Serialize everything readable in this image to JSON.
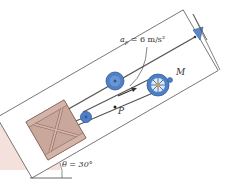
{
  "diagram": {
    "labels": {
      "acceleration": "a_P = 6 m/s²",
      "acceleration_symbol": "a",
      "acceleration_subscript": "P",
      "acceleration_value": " = 6 m/s²",
      "motor": "M",
      "point": "P",
      "angle": "θ = 30°"
    },
    "colors": {
      "crate": "#c9a79b",
      "crate_dark": "#8a6a60",
      "pulley": "#4f7fc4",
      "pulley_dark": "#2f5a9a",
      "incline_shade": "#e9c8c0",
      "cable": "#555555"
    }
  }
}
